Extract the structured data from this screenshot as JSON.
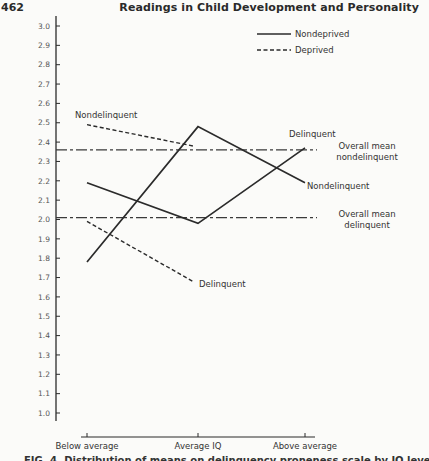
{
  "page": {
    "page_number": "462",
    "running_head": "Readings in Child Development and Personality",
    "caption": "FIG. 4. Distribution of means on delinquency proneness scale by IQ level"
  },
  "chart_data": {
    "type": "line",
    "title": "",
    "xlabel": "",
    "ylabel": "",
    "categories": [
      "Below average",
      "Average IQ",
      "Above average"
    ],
    "ylim": [
      1.0,
      3.0
    ],
    "yticks": [
      "3.0",
      "2.9",
      "2.8",
      "2.7",
      "2.6",
      "2.5",
      "2.4",
      "2.3",
      "2.2",
      "2.1",
      "2.0",
      "1.9",
      "1.8",
      "1.7",
      "1.6",
      "1.5",
      "1.4",
      "1.3",
      "1.2",
      "1.1",
      "1.0"
    ],
    "grid": false,
    "legend": {
      "position": "top-right",
      "entries": [
        {
          "label": "Nondeprived",
          "style": "solid"
        },
        {
          "label": "Deprived",
          "style": "dashed"
        }
      ]
    },
    "series": [
      {
        "name": "Nondeprived Delinquent",
        "style": "solid",
        "values": [
          2.19,
          1.98,
          2.37
        ],
        "label": "Delinquent"
      },
      {
        "name": "Nondeprived Nondelinquent",
        "style": "solid",
        "values": [
          1.78,
          2.48,
          2.19
        ],
        "label": "Nondelinquent"
      },
      {
        "name": "Deprived Nondelinquent",
        "style": "dashed",
        "values": [
          2.49,
          2.38,
          null
        ],
        "label": "Nondelinquent"
      },
      {
        "name": "Deprived Delinquent",
        "style": "dashed",
        "values": [
          1.99,
          1.68,
          null
        ],
        "label": "Delinquent"
      }
    ],
    "reference_lines": [
      {
        "name": "Overall mean nondelinquent",
        "value": 2.36,
        "style": "dash-dot",
        "label_line1": "Overall mean",
        "label_line2": "nondelinquent"
      },
      {
        "name": "Overall mean delinquent",
        "value": 2.01,
        "style": "dash-dot",
        "label_line1": "Overall mean",
        "label_line2": "delinquent"
      }
    ]
  }
}
